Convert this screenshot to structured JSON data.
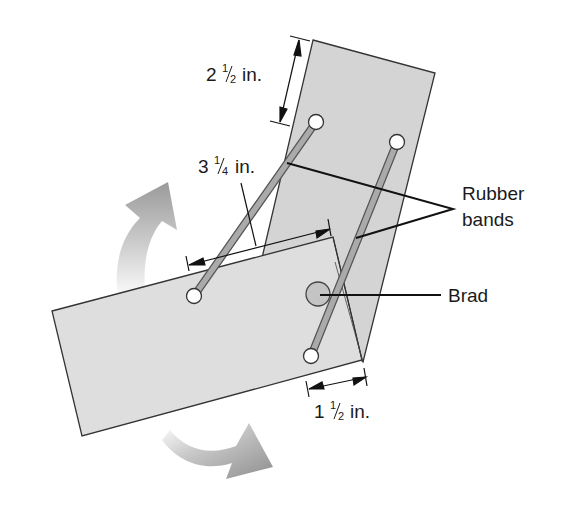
{
  "diagram": {
    "labels": {
      "upper_length": {
        "whole": "2",
        "num": "1",
        "den": "2",
        "unit": "in."
      },
      "band_span": {
        "whole": "3",
        "num": "1",
        "den": "4",
        "unit": "in."
      },
      "lower_offset": {
        "whole": "1",
        "num": "1",
        "den": "2",
        "unit": "in."
      },
      "rubber_bands_line1": "Rubber",
      "rubber_bands_line2": "bands",
      "brad": "Brad"
    },
    "colors": {
      "board_fill": "#dcdcdc",
      "board_upper_fill": "#d2d2d2",
      "board_stroke": "#333333",
      "band_fill": "#a8a8a8",
      "band_stroke": "#555555",
      "arrow_gray": "#9a9a9a",
      "text": "#1a1a1a"
    }
  }
}
